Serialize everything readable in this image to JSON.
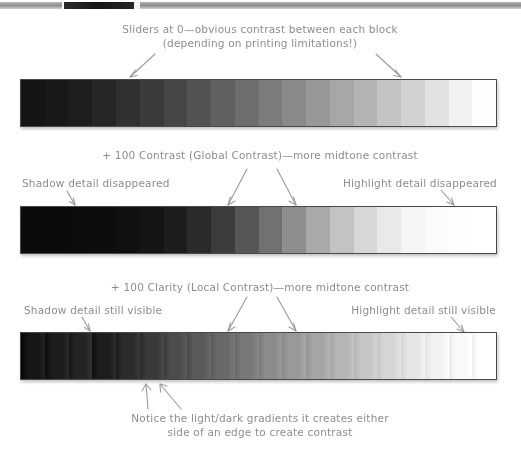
{
  "page": {
    "width": 521,
    "height": 455,
    "background": "#ffffff",
    "ink_color": "#8d8d8d",
    "strip_border_color": "#4a4a4a"
  },
  "top_artifact": {
    "label": "cropped-image-strip-edge"
  },
  "panels": [
    {
      "id": "panel-sliders-at-zero",
      "heading_line_1": "Sliders at 0—obvious contrast between each block",
      "heading_line_2": "(depending on printing limitations!)",
      "left_label": "",
      "right_label": "",
      "bottom_caption_line_1": "",
      "bottom_caption_line_2": "",
      "arrows": [
        "left-into-shadow-blocks",
        "right-into-highlight-blocks"
      ]
    },
    {
      "id": "panel-global-contrast",
      "heading_line_1": "+ 100 Contrast (Global Contrast)—more midtone contrast",
      "heading_line_2": "",
      "left_label": "Shadow detail disappeared",
      "right_label": "Highlight detail disappeared",
      "bottom_caption_line_1": "",
      "bottom_caption_line_2": "",
      "arrows": [
        "shadow-arrow",
        "midtone-left-arrow",
        "midtone-right-arrow",
        "highlight-arrow"
      ]
    },
    {
      "id": "panel-clarity-local-contrast",
      "heading_line_1": "+ 100 Clarity (Local Contrast)—more midtone contrast",
      "heading_line_2": "",
      "left_label": "Shadow detail still visible",
      "right_label": "Highlight detail still visible",
      "bottom_caption_line_1": "Notice the light/dark gradients it creates either",
      "bottom_caption_line_2": "side of an edge to create contrast",
      "arrows": [
        "shadow-arrow",
        "midtone-left-arrow",
        "midtone-right-arrow",
        "highlight-arrow",
        "bottom-arrow-left",
        "bottom-arrow-right"
      ]
    }
  ],
  "chart_data": {
    "type": "bar",
    "xlabel": "",
    "ylabel": "",
    "series": [
      {
        "name": "Sliders at 0",
        "note": "Even linear greyscale ramp, 20 steps, black to white",
        "values": [
          "#141414",
          "#181818",
          "#1e1e1e",
          "#262626",
          "#303030",
          "#3b3b3b",
          "#474747",
          "#535353",
          "#616161",
          "#6f6f6f",
          "#7d7d7d",
          "#8b8b8b",
          "#999999",
          "#a7a7a7",
          "#b5b5b5",
          "#c4c4c4",
          "#d3d3d3",
          "#e2e2e2",
          "#f1f1f1",
          "#fefefe"
        ]
      },
      {
        "name": "+ 100 Contrast (Global Contrast)",
        "note": "S-curve: shadows crushed to black, highlights blown to white, steep midtones",
        "values": [
          "#0b0b0b",
          "#0b0b0b",
          "#0c0c0c",
          "#0d0d0d",
          "#101010",
          "#151515",
          "#1d1d1d",
          "#2a2a2a",
          "#3d3d3d",
          "#565656",
          "#727272",
          "#8f8f8f",
          "#aaaaaa",
          "#c3c3c3",
          "#d8d8d8",
          "#e9e9e9",
          "#f5f5f5",
          "#fbfbfb",
          "#fefefe",
          "#ffffff"
        ]
      },
      {
        "name": "+ 100 Clarity (Local Contrast)",
        "note": "Midtone local contrast boost with halos either side of each edge; shadow and highlight detail retained",
        "values": [
          "#151515",
          "#1b1b1b",
          "#242424",
          "#1d1d1d",
          "#2b2b2b",
          "#3a3a3a",
          "#4c4c4c",
          "#5a5a5a",
          "#6a6a6a",
          "#797979",
          "#8c8c8c",
          "#9a9a9a",
          "#a6a6a6",
          "#b6b6b6",
          "#c6c6c6",
          "#d6d6d6",
          "#e6e6e6",
          "#f2f2f2",
          "#fafafa",
          "#ffffff"
        ]
      }
    ],
    "legend": "none",
    "grid": false
  }
}
